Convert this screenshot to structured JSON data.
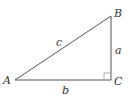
{
  "diagram": {
    "type": "right-triangle",
    "vertices": {
      "A": {
        "label": "A"
      },
      "B": {
        "label": "B"
      },
      "C": {
        "label": "C"
      }
    },
    "sides": {
      "a": {
        "label": "a"
      },
      "b": {
        "label": "b"
      },
      "c": {
        "label": "c"
      }
    },
    "right_angle_at": "C",
    "colors": {
      "stroke": "#555555",
      "text": "#333333"
    }
  }
}
